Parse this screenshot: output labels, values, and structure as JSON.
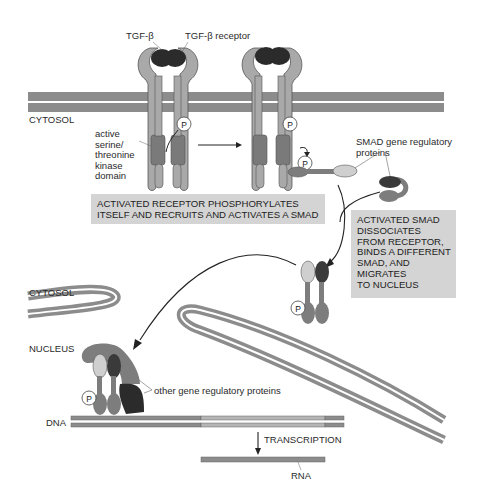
{
  "diagram": {
    "labels": {
      "tgf_beta": "TGF-β",
      "tgf_beta_receptor": "TGF-β receptor",
      "cytosol_top": "CYTOSOL",
      "kinase_domain": [
        "active",
        "serine/",
        "threonine",
        "kinase",
        "domain"
      ],
      "smad_proteins": [
        "SMAD gene regulatory",
        "proteins"
      ],
      "cytosol_bottom": "CYTOSOL",
      "nucleus": "NUCLEUS",
      "other_proteins": "other gene regulatory proteins",
      "dna": "DNA",
      "transcription": "TRANSCRIPTION",
      "rna": "RNA",
      "phosphate": "P"
    },
    "boxes": {
      "step1": [
        "ACTIVATED RECEPTOR PHOSPHORYLATES",
        "ITSELF AND RECRUITS AND ACTIVATES A SMAD"
      ],
      "step2": [
        "ACTIVATED SMAD",
        "DISSOCIATES",
        "FROM RECEPTOR,",
        "BINDS A DIFFERENT",
        "SMAD, AND",
        "MIGRATES",
        "TO NUCLEUS"
      ]
    },
    "colors": {
      "membrane": "#8c8c8c",
      "receptor": "#a9a9a9",
      "kinase": "#7a7a7a",
      "ligand": "#2b2b2b",
      "smad_light": "#cfcfcf",
      "smad_dark": "#3a3a3a",
      "smad_mid": "#7d7d7d",
      "box": "#d4d4d4"
    }
  }
}
